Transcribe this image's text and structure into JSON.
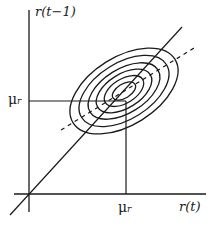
{
  "diagram": {
    "type": "bivariate-contour",
    "axes": {
      "x_label": "r(t)",
      "y_label": "r(t−1)",
      "x_tick_label": "μ",
      "y_tick_label": "μ",
      "x_tick_subscript": "r",
      "y_tick_subscript": "r"
    },
    "elements": {
      "contour_count": 6,
      "diagonal_line": "solid 45-degree line",
      "regression_line": "dashed line through mean",
      "mean_guides": "solid lines from axes to mean point"
    },
    "colors": {
      "stroke": "#1a1a1a",
      "background": "#ffffff"
    }
  }
}
